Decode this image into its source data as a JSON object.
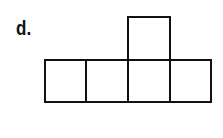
{
  "label": "d.",
  "figure": {
    "stroke_color": "#111111",
    "squares": [
      {
        "id": "row-1",
        "x": 44,
        "y": 59,
        "w": 43,
        "h": 44
      },
      {
        "id": "row-2",
        "x": 85,
        "y": 59,
        "w": 44,
        "h": 44
      },
      {
        "id": "row-3",
        "x": 127,
        "y": 59,
        "w": 44,
        "h": 44
      },
      {
        "id": "row-4",
        "x": 169,
        "y": 59,
        "w": 43,
        "h": 44
      },
      {
        "id": "top-3",
        "x": 127,
        "y": 16,
        "w": 44,
        "h": 45
      }
    ]
  }
}
